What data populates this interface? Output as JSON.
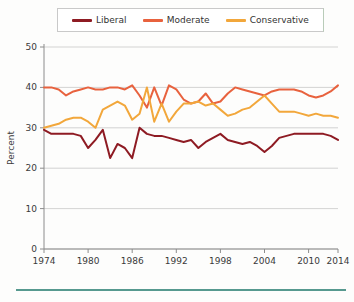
{
  "chart_data": {
    "type": "line",
    "title": "",
    "xlabel": "Year",
    "ylabel": "Percent",
    "xlim": [
      1974,
      2014
    ],
    "ylim": [
      0,
      50
    ],
    "xticks": [
      1974,
      1980,
      1986,
      1992,
      1998,
      2004,
      2010,
      2014
    ],
    "yticks": [
      0,
      10,
      20,
      30,
      40,
      50
    ],
    "grid": "horizontal",
    "legend_position": "top",
    "x": [
      1974,
      1975,
      1976,
      1977,
      1978,
      1979,
      1980,
      1981,
      1982,
      1983,
      1984,
      1985,
      1986,
      1987,
      1988,
      1989,
      1990,
      1991,
      1992,
      1993,
      1994,
      1995,
      1996,
      1997,
      1998,
      1999,
      2000,
      2001,
      2002,
      2003,
      2004,
      2005,
      2006,
      2007,
      2008,
      2009,
      2010,
      2011,
      2012,
      2013,
      2014
    ],
    "series": [
      {
        "name": "Liberal",
        "color": "#8E1B23",
        "values": [
          29.5,
          28.5,
          28.5,
          28.5,
          28.5,
          28.0,
          25.0,
          27.0,
          29.5,
          22.5,
          26.0,
          25.0,
          22.5,
          30.0,
          28.5,
          28.0,
          28.0,
          27.5,
          27.0,
          26.5,
          27.0,
          25.0,
          26.5,
          27.5,
          28.5,
          27.0,
          26.5,
          26.0,
          26.5,
          25.5,
          24.0,
          25.5,
          27.5,
          28.0,
          28.5,
          28.5,
          28.5,
          28.5,
          28.5,
          28.0,
          27.0
        ]
      },
      {
        "name": "Moderate",
        "color": "#E8623E",
        "values": [
          40.0,
          40.0,
          39.5,
          38.0,
          39.0,
          39.5,
          40.0,
          39.5,
          39.5,
          40.0,
          40.0,
          39.5,
          40.5,
          38.0,
          35.0,
          40.0,
          35.5,
          40.5,
          39.5,
          37.0,
          36.0,
          36.5,
          38.5,
          36.0,
          36.5,
          38.5,
          40.0,
          39.5,
          39.0,
          38.5,
          38.0,
          39.0,
          39.5,
          39.5,
          39.5,
          39.0,
          38.0,
          37.5,
          38.0,
          39.0,
          40.5
        ]
      },
      {
        "name": "Conservative",
        "color": "#F2A73B",
        "values": [
          30.0,
          30.5,
          31.0,
          32.0,
          32.5,
          32.5,
          31.5,
          30.0,
          34.5,
          35.5,
          36.5,
          35.5,
          32.0,
          33.5,
          40.0,
          31.5,
          36.0,
          31.5,
          34.0,
          36.0,
          36.0,
          36.5,
          35.5,
          36.0,
          34.5,
          33.0,
          33.5,
          34.5,
          35.0,
          36.5,
          38.0,
          36.0,
          34.0,
          34.0,
          34.0,
          33.5,
          33.0,
          33.5,
          33.0,
          33.0,
          32.5
        ]
      }
    ]
  },
  "legend": {
    "items": [
      {
        "label": "Liberal",
        "color": "#8E1B23"
      },
      {
        "label": "Moderate",
        "color": "#E8623E"
      },
      {
        "label": "Conservative",
        "color": "#F2A73B"
      }
    ]
  },
  "axes": {
    "y_title": "Percent",
    "x_title": "Year",
    "y_tick_labels": [
      "50",
      "40",
      "30",
      "20",
      "10",
      "0"
    ],
    "x_tick_labels": [
      "1974",
      "1980",
      "1986",
      "1992",
      "1998",
      "2004",
      "2010",
      "2014"
    ]
  },
  "colors": {
    "grid": "#c8c8c8",
    "axis": "#8c8c8c",
    "rule": "#56998f",
    "background": "#fdfdfc"
  }
}
